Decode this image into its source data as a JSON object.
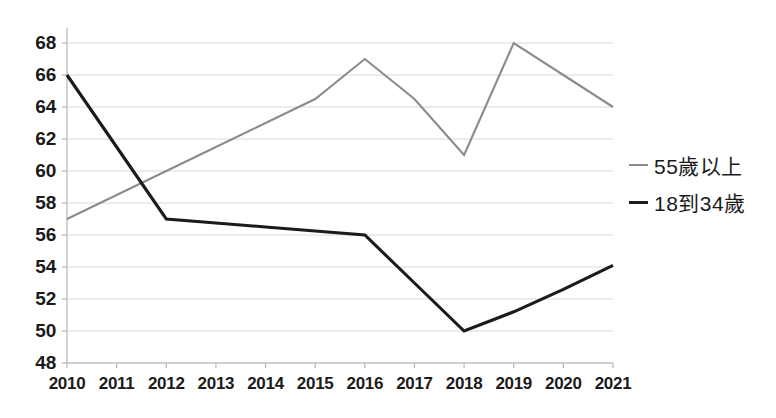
{
  "chart_data": {
    "type": "line",
    "title": "",
    "xlabel": "",
    "ylabel": "",
    "categories": [
      "2010",
      "2011",
      "2012",
      "2013",
      "2014",
      "2015",
      "2016",
      "2017",
      "2018",
      "2019",
      "2020",
      "2021"
    ],
    "ylim": [
      48,
      68
    ],
    "yticks": [
      48,
      50,
      52,
      54,
      56,
      58,
      60,
      62,
      64,
      66,
      68
    ],
    "grid": true,
    "legend_position": "right",
    "series": [
      {
        "name": "55歲以上",
        "color": "#8c8c8c",
        "values": [
          57,
          58.5,
          60,
          61.5,
          63,
          64.5,
          67,
          64.5,
          61,
          68,
          66,
          64
        ]
      },
      {
        "name": "18到34歲",
        "color": "#1b1b1b",
        "values": [
          66,
          61.5,
          57,
          56.75,
          56.5,
          56.25,
          56,
          53,
          50,
          51.2,
          52.6,
          54.1
        ]
      }
    ]
  },
  "axis": {
    "y_tick_labels": [
      "68",
      "66",
      "64",
      "62",
      "60",
      "58",
      "56",
      "54",
      "52",
      "50",
      "48"
    ],
    "x_tick_labels": [
      "2010",
      "2011",
      "2012",
      "2013",
      "2014",
      "2015",
      "2016",
      "2017",
      "2018",
      "2019",
      "2020",
      "2021"
    ]
  },
  "legend": {
    "items": [
      {
        "label": "55歲以上",
        "marker": "line-dash-gray"
      },
      {
        "label": "18到34歲",
        "marker": "line-dash-black"
      }
    ]
  },
  "colors": {
    "series_old": "#8c8c8c",
    "series_young": "#1b1b1b",
    "grid": "#d9d9d9",
    "axis": "#b5b5b5",
    "text": "#1b1b1b",
    "background": "#ffffff"
  }
}
